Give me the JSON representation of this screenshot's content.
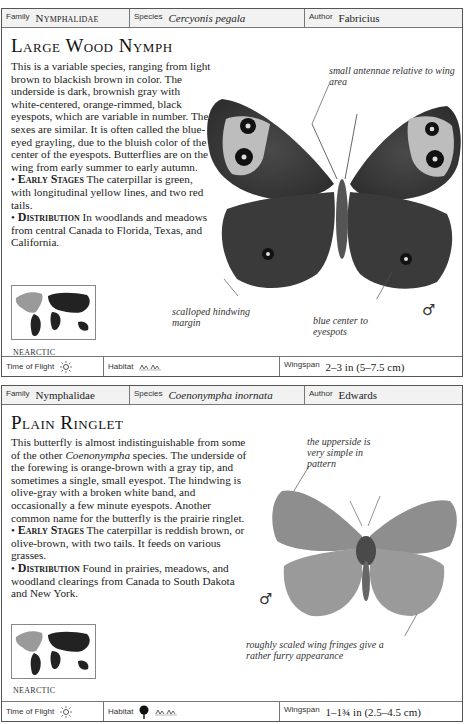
{
  "entries": [
    {
      "family_label": "Family",
      "family": "Nymphalidae",
      "species_label": "Species",
      "species": "Cercyonis pegala",
      "author_label": "Author",
      "author": "Fabricius",
      "title": "Large Wood Nymph",
      "description": "This is a variable species, ranging from light brown to blackish brown in color. The underside is dark, brownish gray with white-centered, orange-rimmed, black eyespots, which are variable in number. The sexes are similar. It is often called the blue-eyed grayling, due to the bluish color of the center of the eyespots. Butterflies are on the wing from early summer to early autumn.",
      "early_stages_label": "Early Stages",
      "early_stages": "The caterpillar is green, with longitudinal yellow lines, and two red tails.",
      "distribution_label": "Distribution",
      "distribution": "In woodlands and meadows from central Canada to Florida, Texas, and California.",
      "region": "NEARCTIC",
      "callouts": [
        "small antennae relative to wing area",
        "scalloped hindwing margin",
        "blue center to eyespots"
      ],
      "sex_symbol": "♂",
      "time_of_flight_label": "Time of Flight",
      "time_of_flight_icon": "sun-icon",
      "habitat_label": "Habitat",
      "habitat_icons": [
        "grassland-icon"
      ],
      "wingspan_label": "Wingspan",
      "wingspan": "2–3 in (5–7.5 cm)"
    },
    {
      "family_label": "Family",
      "family": "Nymphalidae",
      "species_label": "Species",
      "species": "Coenonympha inornata",
      "author_label": "Author",
      "author": "Edwards",
      "title": "Plain Ringlet",
      "description_pre": "This butterfly is almost indistinguishable from some of the other ",
      "description_italic": "Coenonympha",
      "description_post": " species. The underside of the forewing is orange-brown with a gray tip, and sometimes a single, small eyespot. The hindwing is olive-gray with a broken white band, and occasionally a few minute eyespots. Another common name for the butterfly is the prairie ringlet.",
      "early_stages_label": "Early Stages",
      "early_stages": "The caterpillar is reddish brown, or olive-brown, with two tails. It feeds on various grasses.",
      "distribution_label": "Distribution",
      "distribution": "Found in prairies, meadows, and woodland clearings from Canada to South Dakota and New York.",
      "region": "NEARCTIC",
      "callouts": [
        "the upperside is very simple in pattern",
        "roughly scaled wing fringes give a rather furry appearance"
      ],
      "sex_symbol": "♂",
      "time_of_flight_label": "Time of Flight",
      "time_of_flight_icon": "sun-icon",
      "habitat_label": "Habitat",
      "habitat_icons": [
        "tree-icon",
        "grassland-icon"
      ],
      "wingspan_label": "Wingspan",
      "wingspan": "1–1¾ in (2.5–4.5 cm)"
    }
  ]
}
